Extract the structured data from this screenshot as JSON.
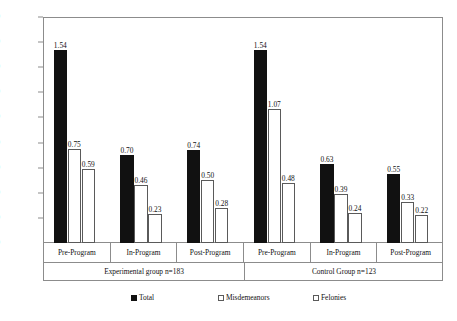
{
  "chart_data": {
    "type": "bar",
    "title": "",
    "subtitle": "",
    "xlabel": "",
    "ylabel": "",
    "ylim": [
      0.0,
      1.8
    ],
    "grid": false,
    "legend_position": "bottom",
    "y_ticks": [
      "0.00",
      "0.20",
      "0.40",
      "0.60",
      "0.80",
      "1.00",
      "1.20",
      "1.40",
      "1.60",
      "1.80"
    ],
    "y_tick_values": [
      0.0,
      0.2,
      0.4,
      0.6,
      0.8,
      1.0,
      1.2,
      1.4,
      1.6,
      1.8
    ],
    "categories": [
      "Pre-Program",
      "In-Program",
      "Post-Program",
      "Pre-Program",
      "In-Program",
      "Post-Program"
    ],
    "groups": [
      {
        "label": "Experimental group n=183",
        "categories": [
          "Pre-Program",
          "In-Program",
          "Post-Program"
        ]
      },
      {
        "label": "Control Group n=123",
        "categories": [
          "Pre-Program",
          "In-Program",
          "Post-Program"
        ]
      }
    ],
    "series": [
      {
        "name": "Total",
        "values": [
          1.54,
          0.7,
          0.74,
          1.54,
          0.63,
          0.55
        ]
      },
      {
        "name": "Misdemeanors",
        "values": [
          0.75,
          0.46,
          0.5,
          1.07,
          0.39,
          0.33
        ]
      },
      {
        "name": "Felonies",
        "values": [
          0.59,
          0.23,
          0.28,
          0.48,
          0.24,
          0.22
        ]
      }
    ],
    "data_labels": [
      [
        "1.54",
        "0.70",
        "0.74",
        "1.54",
        "0.63",
        "0.55"
      ],
      [
        "0.75",
        "0.46",
        "0.50",
        "1.07",
        "0.39",
        "0.33"
      ],
      [
        "0.59",
        "0.23",
        "0.28",
        "0.48",
        "0.24",
        "0.22"
      ]
    ],
    "legend": [
      {
        "label": "Total",
        "swatch": "filled-black-square"
      },
      {
        "label": "Misdemeanors",
        "swatch": "dotted-square"
      },
      {
        "label": "Felonies",
        "swatch": "empty-square"
      }
    ],
    "colors": {
      "total": "#111111",
      "misdemeanors": "#ffffff",
      "felonies": "#ffffff",
      "axis": "#8c8c8c",
      "text": "#111111",
      "background": "#ffffff"
    }
  }
}
